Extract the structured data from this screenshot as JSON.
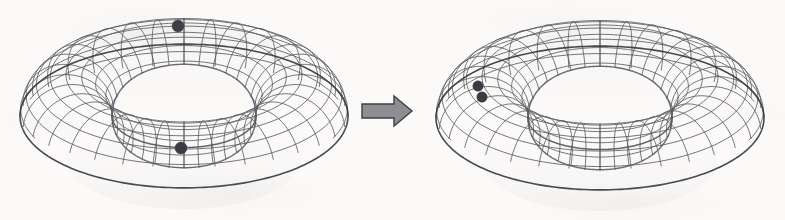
{
  "figure": {
    "background_color": "#fbfaf8",
    "width": 785,
    "height": 220,
    "ink_color": "#4a4a52",
    "mesh_color": "#5a5a62",
    "silhouette_color": "#3a3a42",
    "dot_color": "#3b3b42"
  },
  "panels": [
    {
      "id": "left-torus",
      "label": "Torus before deformation",
      "center": {
        "x": 184,
        "y": 116
      },
      "major_radius": 118,
      "minor_radius": 46,
      "view_tilt_deg": 26,
      "meridian_count": 32,
      "latitude_count": 18,
      "points": [
        {
          "name": "top-marked-point",
          "x": 178,
          "y": 26,
          "radius": 6.0,
          "label": "p"
        },
        {
          "name": "bottom-marked-point",
          "x": 181,
          "y": 148,
          "radius": 6.0,
          "label": "q"
        }
      ]
    },
    {
      "id": "right-torus",
      "label": "Torus after deformation",
      "center": {
        "x": 600,
        "y": 118
      },
      "major_radius": 118,
      "minor_radius": 46,
      "view_tilt_deg": 26,
      "meridian_count": 32,
      "latitude_count": 18,
      "points": [
        {
          "name": "merged-point-upper",
          "x": 478,
          "y": 86,
          "radius": 5.2,
          "label": "p"
        },
        {
          "name": "merged-point-lower",
          "x": 482,
          "y": 97,
          "radius": 5.2,
          "label": "q"
        }
      ]
    }
  ],
  "arrow": {
    "name": "transformation-arrow",
    "label": "maps to",
    "fill_color": "#8d8d92",
    "stroke_color": "#3e3e45",
    "x": 362,
    "y": 96,
    "width": 50,
    "height": 30,
    "shaft_height": 14,
    "head_width": 18
  }
}
